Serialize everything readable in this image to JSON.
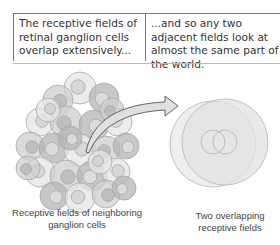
{
  "captions": {
    "left": "The receptive fields of retinal ganglion cells overlap extensively...",
    "right": "...and so any two adjacent fields look at almost the same part of the world."
  },
  "labels": {
    "left": "Receptive fields of neighboring ganglion cells",
    "right": "Two overlapping receptive fields"
  },
  "colors": {
    "field_fill_light": "#e6e6e6",
    "field_fill_mid": "#cfcfcf",
    "field_fill_dark": "#b4b4b4",
    "field_stroke": "#a8a8a8",
    "arrow_fill": "#e0e0e0",
    "arrow_stroke": "#555555",
    "text": "#333333"
  }
}
